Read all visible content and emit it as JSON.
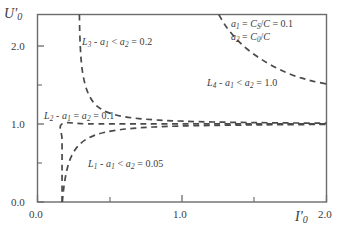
{
  "chart_data": {
    "type": "line",
    "title": "",
    "xlabel": "I'0",
    "ylabel": "U'0",
    "xlim": [
      0.0,
      2.0
    ],
    "ylim": [
      0.0,
      2.4
    ],
    "grid": false,
    "legend_position": "top-right",
    "x_ticks_major": [
      "0.0",
      "1.0",
      "2.0"
    ],
    "x_ticks_major_values": [
      0.0,
      1.0,
      2.0
    ],
    "x_ticks_minor_values": [
      0.5,
      1.5
    ],
    "y_ticks_major": [
      "0.0",
      "1.0",
      "2.0"
    ],
    "y_ticks_major_values": [
      0.0,
      1.0,
      2.0
    ],
    "y_ticks_minor_values": [
      0.5,
      1.5
    ],
    "line_style": "dashed",
    "line_color": "#4a4a4a",
    "series": [
      {
        "name": "L1",
        "label": "L1 - a1 < a2 = 0.05",
        "condition": "a1 < a2 = 0.05",
        "points": [
          [
            0.172,
            0.0
          ],
          [
            0.178,
            0.12
          ],
          [
            0.188,
            0.26
          ],
          [
            0.202,
            0.4
          ],
          [
            0.222,
            0.53
          ],
          [
            0.25,
            0.64
          ],
          [
            0.285,
            0.725
          ],
          [
            0.33,
            0.795
          ],
          [
            0.39,
            0.85
          ],
          [
            0.46,
            0.89
          ],
          [
            0.55,
            0.92
          ],
          [
            0.66,
            0.943
          ],
          [
            0.8,
            0.96
          ],
          [
            0.98,
            0.972
          ],
          [
            1.2,
            0.98
          ],
          [
            1.45,
            0.986
          ],
          [
            1.7,
            0.99
          ],
          [
            2.0,
            0.993
          ]
        ]
      },
      {
        "name": "L2",
        "label": "L2 - a1 = a2 = 0.1",
        "condition": "a1 = a2 = 0.1",
        "points": [
          [
            0.17,
            0.0
          ],
          [
            0.17,
            0.4
          ],
          [
            0.17,
            0.8
          ],
          [
            0.17,
            1.0
          ],
          [
            0.35,
            1.0
          ],
          [
            0.7,
            1.0
          ],
          [
            1.1,
            1.0
          ],
          [
            1.5,
            1.0
          ],
          [
            2.0,
            1.0
          ]
        ]
      },
      {
        "name": "L3",
        "label": "L3 - a1 < a2 = 0.2",
        "condition": "a1 < a2 = 0.2",
        "points": [
          [
            0.29,
            2.4
          ],
          [
            0.292,
            2.2
          ],
          [
            0.296,
            2.0
          ],
          [
            0.302,
            1.82
          ],
          [
            0.312,
            1.66
          ],
          [
            0.33,
            1.5
          ],
          [
            0.356,
            1.37
          ],
          [
            0.392,
            1.265
          ],
          [
            0.44,
            1.19
          ],
          [
            0.505,
            1.135
          ],
          [
            0.59,
            1.095
          ],
          [
            0.7,
            1.068
          ],
          [
            0.84,
            1.048
          ],
          [
            1.01,
            1.034
          ],
          [
            1.22,
            1.024
          ],
          [
            1.47,
            1.017
          ],
          [
            1.73,
            1.012
          ],
          [
            2.0,
            1.009
          ]
        ]
      },
      {
        "name": "L4",
        "label": "L4 - a1 < a2 = 1.0",
        "condition": "a1 < a2 = 1.0",
        "points": [
          [
            1.255,
            2.4
          ],
          [
            1.3,
            2.26
          ],
          [
            1.36,
            2.12
          ],
          [
            1.43,
            1.99
          ],
          [
            1.51,
            1.875
          ],
          [
            1.59,
            1.78
          ],
          [
            1.67,
            1.7
          ],
          [
            1.75,
            1.635
          ],
          [
            1.83,
            1.585
          ],
          [
            1.91,
            1.545
          ],
          [
            2.0,
            1.51
          ]
        ]
      }
    ],
    "annotations": [
      {
        "name": "a1-definition",
        "text": "a1 = CS/C = 0.1"
      },
      {
        "name": "a2-definition",
        "text": "a2 = C0/C"
      }
    ]
  },
  "axes": {
    "y_title_main": "U",
    "y_title_sub": "0",
    "x_title_main": "I",
    "x_title_sub": "0",
    "prime": "′"
  },
  "labels": {
    "y_tick_0": "0.0",
    "y_tick_1": "1.0",
    "y_tick_2": "2.0",
    "x_tick_0": "0.0",
    "x_tick_1": "1.0",
    "x_tick_2": "2.0",
    "L1_name": "L",
    "L1_sub": "1",
    "L1_rest": " - ",
    "L1_a1": "a",
    "L1_a1sub": "1",
    "L1_rel": " < ",
    "L1_a2": "a",
    "L1_a2sub": "2",
    "L1_val": " = 0.05",
    "L2_sub": "2",
    "L2_rel": " = ",
    "L2_val": " = 0.1",
    "L3_sub": "3",
    "L3_val": " = 0.2",
    "L4_sub": "4",
    "L4_val": " = 1.0",
    "legend_a1_lhs": "a",
    "legend_a1_sub": "1",
    "legend_a1_eq": " = ",
    "legend_a1_C": "C",
    "legend_a1_Csub": "S",
    "legend_a1_div": "/",
    "legend_a1_C2": "C",
    "legend_a1_val": " = 0.1",
    "legend_a2_lhs": "a",
    "legend_a2_sub": "2",
    "legend_a2_eq": " = ",
    "legend_a2_C": "C",
    "legend_a2_Csub": "0",
    "legend_a2_div": "/",
    "legend_a2_C2": "C"
  }
}
